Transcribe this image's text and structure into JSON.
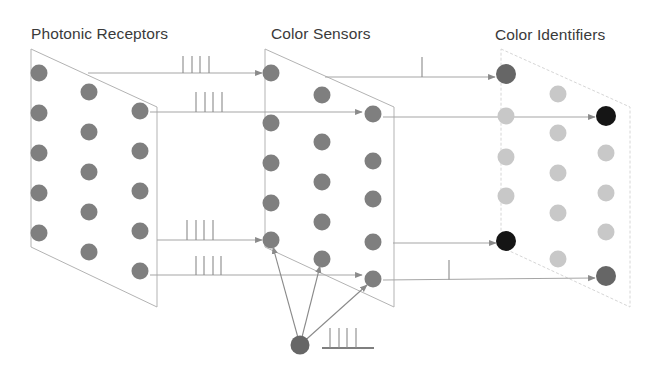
{
  "labels": {
    "photonic_receptors": "Photonic Receptors",
    "color_sensors": "Color Sensors",
    "color_identifiers": "Color Identifiers"
  },
  "colors": {
    "node_gray": "#7f7f7f",
    "node_light": "#c8c8c8",
    "node_dark": "#666666",
    "node_black": "#151515",
    "line": "#a6a6a6",
    "panel_edge": "#b3b3b3",
    "panel_edge_light": "#d6d6d6"
  },
  "layers": [
    {
      "name": "photonic-receptors",
      "panel": {
        "x_left": 31,
        "x_right": 157,
        "top_left": 49,
        "top_right": 107,
        "bottom_left": 247,
        "bottom_right": 307
      },
      "nodes": [
        {
          "x": 39,
          "y": 73,
          "c": "gray"
        },
        {
          "x": 39,
          "y": 113,
          "c": "gray"
        },
        {
          "x": 39,
          "y": 153,
          "c": "gray"
        },
        {
          "x": 39,
          "y": 193,
          "c": "gray"
        },
        {
          "x": 39,
          "y": 233,
          "c": "gray"
        },
        {
          "x": 89,
          "y": 92,
          "c": "gray"
        },
        {
          "x": 89,
          "y": 132,
          "c": "gray"
        },
        {
          "x": 89,
          "y": 172,
          "c": "gray"
        },
        {
          "x": 89,
          "y": 212,
          "c": "gray"
        },
        {
          "x": 89,
          "y": 252,
          "c": "gray"
        },
        {
          "x": 140,
          "y": 111,
          "c": "gray"
        },
        {
          "x": 140,
          "y": 151,
          "c": "gray"
        },
        {
          "x": 140,
          "y": 191,
          "c": "gray"
        },
        {
          "x": 140,
          "y": 231,
          "c": "gray"
        },
        {
          "x": 140,
          "y": 271,
          "c": "gray"
        }
      ]
    },
    {
      "name": "color-sensors",
      "panel": {
        "x_left": 265,
        "x_right": 394,
        "top_left": 49,
        "top_right": 107,
        "bottom_left": 247,
        "bottom_right": 307
      },
      "nodes": [
        {
          "x": 271,
          "y": 73,
          "c": "gray"
        },
        {
          "x": 271,
          "y": 123,
          "c": "gray"
        },
        {
          "x": 271,
          "y": 163,
          "c": "gray"
        },
        {
          "x": 271,
          "y": 203,
          "c": "gray"
        },
        {
          "x": 271,
          "y": 240,
          "c": "gray"
        },
        {
          "x": 322,
          "y": 95,
          "c": "gray"
        },
        {
          "x": 322,
          "y": 142,
          "c": "gray"
        },
        {
          "x": 322,
          "y": 182,
          "c": "gray"
        },
        {
          "x": 322,
          "y": 222,
          "c": "gray"
        },
        {
          "x": 322,
          "y": 259,
          "c": "gray"
        },
        {
          "x": 373,
          "y": 114,
          "c": "gray"
        },
        {
          "x": 373,
          "y": 161,
          "c": "gray"
        },
        {
          "x": 373,
          "y": 199,
          "c": "gray"
        },
        {
          "x": 373,
          "y": 242,
          "c": "gray"
        },
        {
          "x": 373,
          "y": 279,
          "c": "gray"
        }
      ]
    },
    {
      "name": "color-identifiers",
      "panel": {
        "x_left": 501,
        "x_right": 630,
        "top_left": 49,
        "top_right": 107,
        "bottom_left": 247,
        "bottom_right": 307
      },
      "nodes": [
        {
          "x": 506,
          "y": 74,
          "c": "dark"
        },
        {
          "x": 506,
          "y": 116,
          "c": "light"
        },
        {
          "x": 506,
          "y": 157,
          "c": "light"
        },
        {
          "x": 506,
          "y": 196,
          "c": "light"
        },
        {
          "x": 506,
          "y": 241,
          "c": "black"
        },
        {
          "x": 558,
          "y": 94,
          "c": "light"
        },
        {
          "x": 558,
          "y": 133,
          "c": "light"
        },
        {
          "x": 558,
          "y": 173,
          "c": "light"
        },
        {
          "x": 558,
          "y": 213,
          "c": "light"
        },
        {
          "x": 558,
          "y": 259,
          "c": "light"
        },
        {
          "x": 606,
          "y": 116,
          "c": "black"
        },
        {
          "x": 606,
          "y": 153,
          "c": "light"
        },
        {
          "x": 606,
          "y": 193,
          "c": "light"
        },
        {
          "x": 606,
          "y": 232,
          "c": "light"
        },
        {
          "x": 606,
          "y": 276,
          "c": "dark"
        }
      ]
    }
  ],
  "connections": [
    {
      "x1": 88,
      "y1": 73,
      "x2": 262,
      "y2": 73,
      "spikes": [
        183,
        192,
        200,
        209
      ],
      "spike_top": 56
    },
    {
      "x1": 150,
      "y1": 112,
      "x2": 362,
      "y2": 112,
      "spikes": [
        196,
        205,
        213,
        222
      ],
      "spike_top": 92
    },
    {
      "x1": 157,
      "y1": 240,
      "x2": 262,
      "y2": 240,
      "spikes": [
        187,
        196,
        204,
        213
      ],
      "spike_top": 220
    },
    {
      "x1": 150,
      "y1": 275,
      "x2": 362,
      "y2": 275,
      "spikes": [
        196,
        204,
        213,
        221
      ],
      "spike_top": 256
    },
    {
      "x1": 325,
      "y1": 77,
      "x2": 495,
      "y2": 77,
      "spikes": [
        422
      ],
      "spike_top": 57
    },
    {
      "x1": 383,
      "y1": 117,
      "x2": 595,
      "y2": 117,
      "spikes": [],
      "spike_top": 0
    },
    {
      "x1": 393,
      "y1": 243,
      "x2": 496,
      "y2": 243,
      "spikes": [],
      "spike_top": 0
    },
    {
      "x1": 383,
      "y1": 280,
      "x2": 595,
      "y2": 278,
      "spikes": [
        449
      ],
      "spike_top": 260
    }
  ],
  "modulator": {
    "node": {
      "x": 300,
      "y": 345,
      "c": "dark"
    },
    "targets": [
      {
        "x": 273,
        "y": 247
      },
      {
        "x": 320,
        "y": 266
      },
      {
        "x": 367,
        "y": 285
      }
    ],
    "spike_train": {
      "baseline_x1": 322,
      "baseline_x2": 374,
      "baseline_y": 348,
      "spikes": [
        330,
        339,
        347,
        356
      ],
      "spike_top": 328
    }
  }
}
